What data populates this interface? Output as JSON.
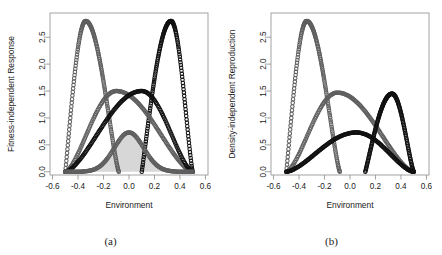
{
  "figure": {
    "panels": [
      {
        "id": "a",
        "caption": "(a)",
        "xlabel": "Environment",
        "ylabel": "Fitness-independent Response"
      },
      {
        "id": "b",
        "caption": "(b)",
        "xlabel": "Environment",
        "ylabel": "Density-independent Reproduction"
      }
    ]
  },
  "colors": {
    "black_curve": "#111111",
    "gray_curve": "#5f5f5f",
    "shaded_fill": "#d7d7d7",
    "axis": "#8a8a8a",
    "background": "#ffffff"
  },
  "chart_data": [
    {
      "type": "line",
      "panel": "a",
      "title": "",
      "xlabel": "Environment",
      "ylabel": "Fitness-independent Response",
      "xlim": [
        -0.62,
        0.62
      ],
      "ylim": [
        -0.06,
        2.95
      ],
      "xticks": [
        -0.6,
        -0.4,
        -0.2,
        0.0,
        0.2,
        0.4,
        0.6
      ],
      "xticklabels": [
        "-0.6",
        "-0.4",
        "-0.2",
        "0.0",
        "0.2",
        "0.4",
        "0.6"
      ],
      "yticks": [
        0.0,
        0.5,
        1.0,
        1.5,
        2.0,
        2.5
      ],
      "yticklabels": [
        "0.0",
        "0.5",
        "1.0",
        "1.5",
        "2.0",
        "2.5"
      ],
      "grid": false,
      "legend": "none",
      "marker": "open-circle",
      "series": [
        {
          "name": "gray-tall-peak",
          "color": "#5f5f5f",
          "peak_x": -0.34,
          "peak_y": 2.8,
          "x_start": -0.5,
          "x_end": -0.08,
          "shape": "skewed-peak"
        },
        {
          "name": "black-tall-peak",
          "color": "#111111",
          "peak_x": 0.33,
          "peak_y": 2.8,
          "x_start": 0.1,
          "x_end": 0.5,
          "shape": "skewed-peak"
        },
        {
          "name": "gray-dome",
          "color": "#5f5f5f",
          "peak_x": -0.1,
          "peak_y": 1.5,
          "x_start": -0.5,
          "x_end": 0.5,
          "shape": "broad-dome"
        },
        {
          "name": "black-dome",
          "color": "#111111",
          "peak_x": 0.1,
          "peak_y": 1.5,
          "x_start": -0.5,
          "x_end": 0.5,
          "shape": "broad-dome"
        },
        {
          "name": "shaded-hill",
          "color": "#5f5f5f",
          "fill": "#d7d7d7",
          "peak_x": 0.0,
          "peak_y": 0.73,
          "x_start": -0.5,
          "x_end": 0.5,
          "shape": "narrow-filled-hill"
        }
      ]
    },
    {
      "type": "line",
      "panel": "b",
      "title": "",
      "xlabel": "Environment",
      "ylabel": "Density-independent Reproduction",
      "xlim": [
        -0.62,
        0.62
      ],
      "ylim": [
        -0.06,
        2.95
      ],
      "xticks": [
        -0.6,
        -0.4,
        -0.2,
        0.0,
        0.2,
        0.4,
        0.6
      ],
      "xticklabels": [
        "-0.6",
        "-0.4",
        "-0.2",
        "0.0",
        "0.2",
        "0.4",
        "0.6"
      ],
      "yticks": [
        0.0,
        0.5,
        1.0,
        1.5,
        2.0,
        2.5
      ],
      "yticklabels": [
        "0.0",
        "0.5",
        "1.0",
        "1.5",
        "2.0",
        "2.5"
      ],
      "grid": false,
      "legend": "none",
      "marker": "open-circle",
      "series": [
        {
          "name": "gray-tall-peak",
          "color": "#5f5f5f",
          "peak_x": -0.34,
          "peak_y": 2.8,
          "x_start": -0.5,
          "x_end": -0.08,
          "shape": "skewed-peak"
        },
        {
          "name": "gray-dome",
          "color": "#5f5f5f",
          "peak_x": -0.1,
          "peak_y": 1.47,
          "x_start": -0.5,
          "x_end": 0.5,
          "shape": "broad-dome"
        },
        {
          "name": "black-dome",
          "color": "#111111",
          "peak_x": 0.05,
          "peak_y": 0.73,
          "x_start": -0.5,
          "x_end": 0.5,
          "shape": "broad-dome"
        },
        {
          "name": "black-peak",
          "color": "#111111",
          "peak_x": 0.33,
          "peak_y": 1.45,
          "x_start": 0.12,
          "x_end": 0.5,
          "shape": "skewed-peak"
        }
      ]
    }
  ]
}
